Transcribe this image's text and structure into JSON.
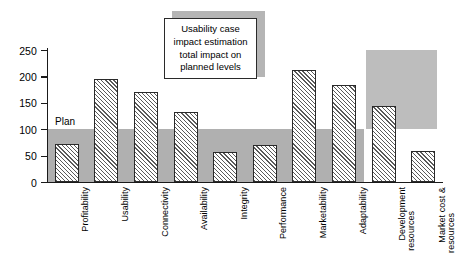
{
  "chart_data": {
    "type": "bar",
    "title": "",
    "subtitle": "",
    "xlabel": "",
    "ylabel": "",
    "ylim": [
      0,
      250
    ],
    "yticks": [
      0,
      50,
      100,
      150,
      200,
      250
    ],
    "grid": false,
    "legend": "none",
    "categories": [
      "Profitability",
      "Usability",
      "Connectivity",
      "Availability",
      "Integrity",
      "Performance",
      "Marketability",
      "Adaptability",
      "Development resources",
      "Market cost & resources"
    ],
    "values": [
      72,
      195,
      171,
      133,
      57,
      71,
      213,
      183,
      144,
      59
    ],
    "series": [
      {
        "name": "Estimated impact on planned level",
        "values": [
          72,
          195,
          171,
          133,
          57,
          71,
          213,
          183,
          144,
          59
        ]
      }
    ],
    "reference_line": {
      "label": "Plan",
      "value": 100
    },
    "shaded_regions": [
      {
        "name": "plan-band",
        "label": "Plan",
        "y_from": 0,
        "y_to": 100,
        "x_from_category": "Profitability",
        "x_to_category": "Adaptability",
        "color": "#b0b0b0"
      },
      {
        "name": "resource-block",
        "label": "",
        "y_from": 100,
        "y_to": 250,
        "x_from_category": "Development resources",
        "x_to_category": "Market cost & resources",
        "color": "#bdbdbd"
      }
    ],
    "annotations": [
      {
        "name": "callout",
        "lines": [
          "Usability case",
          "impact estimation",
          "total impact on",
          "planned levels"
        ]
      }
    ]
  },
  "axis": {
    "y_tick_labels": [
      "250",
      "200",
      "150",
      "100",
      "50",
      "0"
    ]
  },
  "plan": {
    "label": "Plan"
  },
  "callout": {
    "line1": "Usability case",
    "line2": "impact estimation",
    "line3": "total impact on",
    "line4": "planned levels"
  },
  "x_labels": [
    {
      "line1": "Profitability",
      "line2": ""
    },
    {
      "line1": "Usability",
      "line2": ""
    },
    {
      "line1": "Connectivity",
      "line2": ""
    },
    {
      "line1": "Availability",
      "line2": ""
    },
    {
      "line1": "Integrity",
      "line2": ""
    },
    {
      "line1": "Performance",
      "line2": ""
    },
    {
      "line1": "Marketability",
      "line2": ""
    },
    {
      "line1": "Adaptability",
      "line2": ""
    },
    {
      "line1": "Development",
      "line2": "resources"
    },
    {
      "line1": "Market cost &",
      "line2": "resources"
    }
  ],
  "colors": {
    "band": "#b0b0b0",
    "block": "#bdbdbd",
    "bar_hatch": "#5a5a5a",
    "axis": "#1a1a1a"
  }
}
